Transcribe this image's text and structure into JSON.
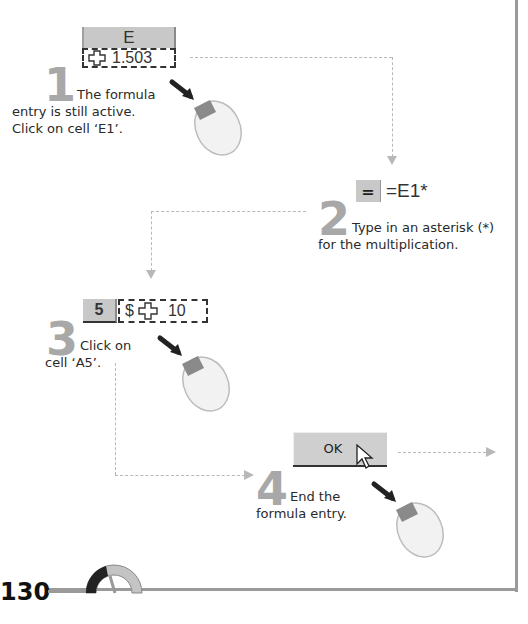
{
  "steps": [
    {
      "number": "1",
      "ui": {
        "column_header": "E",
        "cell_value": "1.503",
        "cell_icon": "plus-cross-cursor-icon"
      },
      "caption_line1": "The formula",
      "caption_line2": "entry is still active.",
      "caption_line3": "Click on cell ‘E1’."
    },
    {
      "number": "2",
      "ui": {
        "equals_button": "=",
        "formula": "=E1*"
      },
      "caption_line1": "Type in an asterisk (*)",
      "caption_line2": "for the multiplication."
    },
    {
      "number": "3",
      "ui": {
        "row_header": "5",
        "cell_prefix": "$",
        "cell_value": "10",
        "cell_icon": "plus-cross-cursor-icon"
      },
      "caption_line1": "Click on",
      "caption_line2": "cell ‘A5’."
    },
    {
      "number": "4",
      "ui": {
        "ok_label": "OK"
      },
      "caption_line1": "End the",
      "caption_line2": "formula entry."
    }
  ],
  "footer": {
    "page_number": "130"
  },
  "colors": {
    "step_number": "#a8a8a8",
    "cell_header": "#c8c8c8",
    "connector": "#b8b8b8"
  }
}
